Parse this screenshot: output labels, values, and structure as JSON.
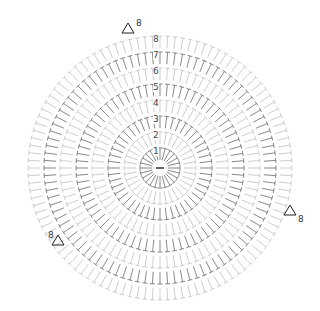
{
  "diagram": {
    "type": "crochet-round-chart",
    "center": {
      "x": 160,
      "y": 168
    },
    "rounds": 8,
    "row_numbers": [
      "1",
      "2",
      "3",
      "4",
      "5",
      "6",
      "7",
      "8"
    ],
    "colors": {
      "dark": "#555555",
      "light": "#b8b8b8",
      "marker": "#888888"
    },
    "end_markers": [
      {
        "label": "8",
        "x": 128,
        "y": 28
      },
      {
        "label": "8",
        "x": 290,
        "y": 210
      },
      {
        "label": "8",
        "x": 58,
        "y": 240
      }
    ]
  }
}
